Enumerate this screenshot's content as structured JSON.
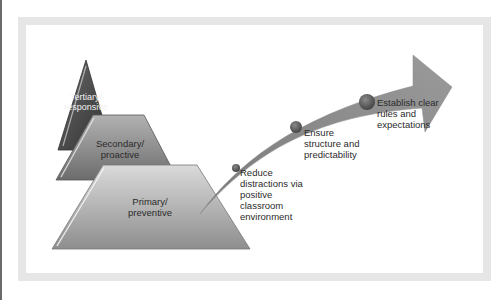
{
  "diagram": {
    "type": "tiered-pyramid-with-arrow",
    "tiers": [
      {
        "id": "tertiary",
        "line1": "Tertiary/",
        "line2": "responsive"
      },
      {
        "id": "secondary",
        "line1": "Secondary/",
        "line2": "proactive"
      },
      {
        "id": "primary",
        "line1": "Primary/",
        "line2": "preventive"
      }
    ],
    "arrow_steps": [
      {
        "lines": [
          "Reduce",
          "distractions via",
          "positive",
          "classroom",
          "environment"
        ]
      },
      {
        "lines": [
          "Ensure",
          "structure and",
          "predictability"
        ]
      },
      {
        "lines": [
          "Establish clear",
          "rules and",
          "expectations"
        ]
      }
    ],
    "colors": {
      "frame": "#e6e6e6",
      "tertiary": "#4a4a4a",
      "secondary": "#8c8c8c",
      "primary": "#b8b8b8",
      "arrow": "#8a8a8a",
      "dot": "#6e6e6e"
    }
  }
}
